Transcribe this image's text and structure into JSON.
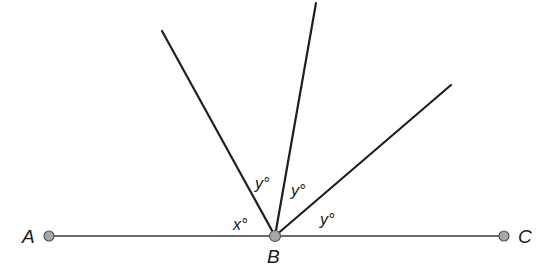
{
  "diagram": {
    "type": "geometry-angles",
    "points": [
      {
        "id": "A",
        "label": "A",
        "x": 49,
        "y": 236
      },
      {
        "id": "B",
        "label": "B",
        "x": 275,
        "y": 236
      },
      {
        "id": "C",
        "label": "C",
        "x": 504,
        "y": 236
      }
    ],
    "rays_from_B": [
      {
        "id": "ray1",
        "end_x": 162,
        "end_y": 31
      },
      {
        "id": "ray2",
        "end_x": 316,
        "end_y": 3
      },
      {
        "id": "ray3",
        "end_x": 451,
        "end_y": 85
      }
    ],
    "angle_labels": [
      {
        "id": "x",
        "text": "x°",
        "x": 233,
        "y": 230
      },
      {
        "id": "y1",
        "text": "y°",
        "x": 255,
        "y": 189
      },
      {
        "id": "y2",
        "text": "y°",
        "x": 291,
        "y": 196
      },
      {
        "id": "y3",
        "text": "y°",
        "x": 320,
        "y": 225
      }
    ],
    "colors": {
      "line": "#1f1f1f",
      "point_fill": "#a8a8a8",
      "point_stroke": "#555555",
      "text": "#1a1a1a"
    }
  }
}
